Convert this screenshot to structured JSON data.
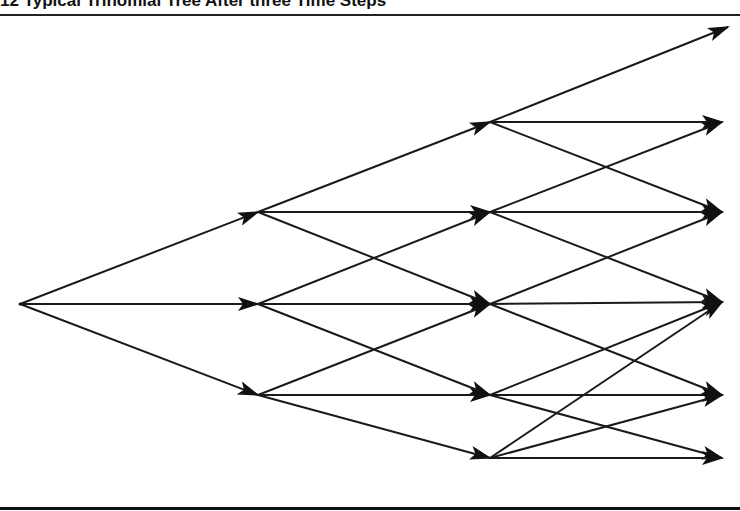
{
  "figure": {
    "title": "12  Typical Trinomial Tree After three Time Steps"
  },
  "diagram": {
    "type": "trinomial-tree",
    "steps": 3,
    "colors": {
      "line": "#1a1a1a",
      "arrow": "#111111"
    },
    "nodes": [
      {
        "id": "n0",
        "x": 20,
        "y": 304
      },
      {
        "id": "a0",
        "x": 258,
        "y": 212
      },
      {
        "id": "a1",
        "x": 258,
        "y": 304
      },
      {
        "id": "a2",
        "x": 258,
        "y": 395
      },
      {
        "id": "b0",
        "x": 490,
        "y": 122
      },
      {
        "id": "b1",
        "x": 490,
        "y": 212
      },
      {
        "id": "b2",
        "x": 490,
        "y": 304
      },
      {
        "id": "b3",
        "x": 490,
        "y": 395
      },
      {
        "id": "b4",
        "x": 490,
        "y": 458
      },
      {
        "id": "c0",
        "x": 728,
        "y": 27
      },
      {
        "id": "c1",
        "x": 722,
        "y": 122
      },
      {
        "id": "c2",
        "x": 722,
        "y": 212
      },
      {
        "id": "c3",
        "x": 722,
        "y": 302
      },
      {
        "id": "c4",
        "x": 722,
        "y": 395
      },
      {
        "id": "c5",
        "x": 722,
        "y": 458
      }
    ],
    "edges": [
      [
        "n0",
        "a0"
      ],
      [
        "n0",
        "a1"
      ],
      [
        "n0",
        "a2"
      ],
      [
        "a0",
        "b0"
      ],
      [
        "a0",
        "b1"
      ],
      [
        "a0",
        "b2"
      ],
      [
        "a1",
        "b1"
      ],
      [
        "a1",
        "b2"
      ],
      [
        "a1",
        "b3"
      ],
      [
        "a2",
        "b2"
      ],
      [
        "a2",
        "b3"
      ],
      [
        "a2",
        "b4"
      ],
      [
        "b0",
        "c0"
      ],
      [
        "b0",
        "c1"
      ],
      [
        "b0",
        "c2"
      ],
      [
        "b1",
        "c1"
      ],
      [
        "b1",
        "c2"
      ],
      [
        "b1",
        "c3"
      ],
      [
        "b2",
        "c2"
      ],
      [
        "b2",
        "c3"
      ],
      [
        "b2",
        "c4"
      ],
      [
        "b3",
        "c3"
      ],
      [
        "b3",
        "c4"
      ],
      [
        "b3",
        "c5"
      ],
      [
        "b4",
        "c3"
      ],
      [
        "b4",
        "c4"
      ],
      [
        "b4",
        "c5"
      ]
    ]
  }
}
